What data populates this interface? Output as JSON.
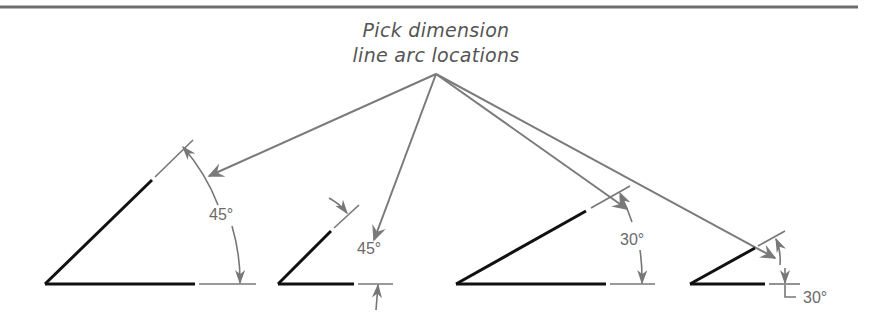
{
  "callout": {
    "line1": "Pick dimension",
    "line2": "line arc locations"
  },
  "figures": [
    {
      "id": "fig1",
      "label": "45°",
      "angle_deg": 45,
      "arrow_placement": "inside"
    },
    {
      "id": "fig2",
      "label": "45°",
      "angle_deg": 45,
      "arrow_placement": "outside"
    },
    {
      "id": "fig3",
      "label": "30°",
      "angle_deg": 30,
      "arrow_placement": "inside"
    },
    {
      "id": "fig4",
      "label": "30°",
      "angle_deg": 30,
      "arrow_placement": "outside-text"
    }
  ],
  "colors": {
    "object_line": "#111111",
    "dimension_line": "#777777",
    "leader_line": "#7a7a7a",
    "top_rule": "#6e6e6e",
    "text": "#555555"
  }
}
